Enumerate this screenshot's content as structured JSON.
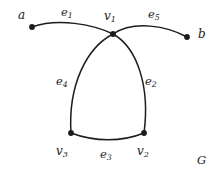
{
  "figure": {
    "name": "undirected-graph-diagram",
    "caption_label": "G",
    "background_color": "#ffffff",
    "ink_color": "#1c1c1c"
  },
  "nodes": [
    {
      "id": "a",
      "base": "a",
      "sub": "",
      "x": 32,
      "y": 27,
      "label_x": 18,
      "label_y": 9,
      "is_dot": true
    },
    {
      "id": "b",
      "base": "b",
      "sub": "",
      "x": 187,
      "y": 37,
      "label_x": 198,
      "label_y": 28,
      "is_dot": true
    },
    {
      "id": "v1",
      "base": "v",
      "sub": "1",
      "x": 113,
      "y": 34,
      "label_x": 104,
      "label_y": 10,
      "is_dot": true
    },
    {
      "id": "v2",
      "base": "v",
      "sub": "2",
      "x": 144,
      "y": 133,
      "label_x": 137,
      "label_y": 145,
      "is_dot": true
    },
    {
      "id": "v3",
      "base": "v",
      "sub": "3",
      "x": 71,
      "y": 133,
      "label_x": 56,
      "label_y": 145,
      "is_dot": true
    }
  ],
  "edges": [
    {
      "id": "e1",
      "base": "e",
      "sub": "1",
      "from": "a",
      "to": "v1",
      "label_x": 61,
      "label_y": 7,
      "path": "M 32 27 C 58 18, 92 24, 113 34"
    },
    {
      "id": "e5",
      "base": "e",
      "sub": "5",
      "from": "v1",
      "to": "b",
      "label_x": 148,
      "label_y": 9,
      "path": "M 113 34 C 134 20, 167 26, 187 37"
    },
    {
      "id": "e4",
      "base": "e",
      "sub": "4",
      "from": "v1",
      "to": "v3",
      "label_x": 56,
      "label_y": 76,
      "path": "M 113 34 C 86 48, 68 86, 71 133"
    },
    {
      "id": "e2",
      "base": "e",
      "sub": "2",
      "from": "v1",
      "to": "v2",
      "label_x": 145,
      "label_y": 76,
      "path": "M 113 34 C 138 48, 150 88, 144 133"
    },
    {
      "id": "e3",
      "base": "e",
      "sub": "3",
      "from": "v3",
      "to": "v2",
      "label_x": 100,
      "label_y": 149,
      "path": "M 71 133 C 95 142, 122 142, 144 133"
    }
  ],
  "caption": {
    "text": "G",
    "x": 197,
    "y": 155
  }
}
